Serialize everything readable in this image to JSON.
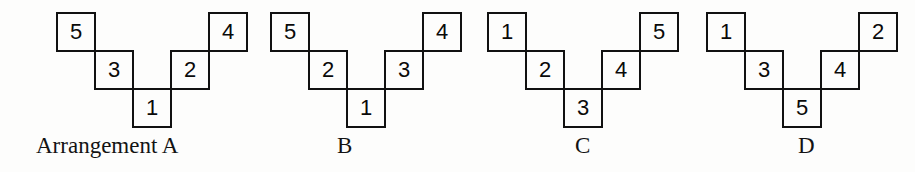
{
  "figure": {
    "background_color": "#fdfdfc",
    "line_color": "#111111",
    "text_color": "#131313",
    "square_size_px": 40,
    "cell_positions": [
      {
        "col": 0,
        "row": 0
      },
      {
        "col": 1,
        "row": 1
      },
      {
        "col": 2,
        "row": 2
      },
      {
        "col": 3,
        "row": 1
      },
      {
        "col": 4,
        "row": 0
      }
    ]
  },
  "arrangements": [
    {
      "id": "a",
      "caption": "Arrangement A",
      "left_px": 56,
      "top_px": 12,
      "caption_left_px": 36,
      "caption_top_px": 133,
      "numbers": [
        "5",
        "3",
        "1",
        "2",
        "4"
      ]
    },
    {
      "id": "b",
      "caption": "B",
      "left_px": 270,
      "top_px": 12,
      "caption_left_px": 337,
      "caption_top_px": 133,
      "numbers": [
        "5",
        "2",
        "1",
        "3",
        "4"
      ]
    },
    {
      "id": "c",
      "caption": "C",
      "left_px": 487,
      "top_px": 12,
      "caption_left_px": 575,
      "caption_top_px": 133,
      "numbers": [
        "1",
        "2",
        "3",
        "4",
        "5"
      ]
    },
    {
      "id": "d",
      "caption": "D",
      "left_px": 706,
      "top_px": 12,
      "caption_left_px": 798,
      "caption_top_px": 133,
      "numbers": [
        "1",
        "3",
        "5",
        "4",
        "2"
      ]
    }
  ]
}
